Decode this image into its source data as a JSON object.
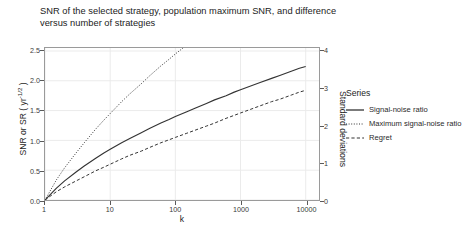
{
  "chart_data": {
    "type": "line",
    "title": "SNR of the selected strategy, population maximum SNR, and difference\nversus number of strategies",
    "xlabel": "k",
    "ylabel_left": "SNR or SR ( yr",
    "ylabel_left_exponent": "-1/2",
    "ylabel_left_tail": " )",
    "ylabel_right": "Standard deviations",
    "xscale": "log",
    "xlim": [
      1,
      16000
    ],
    "ylim_left": [
      0.0,
      2.55
    ],
    "ylim_right": [
      0.0,
      4.08
    ],
    "grid": true,
    "legend_position": "right",
    "legend_title": "Series",
    "xticks": [
      "1",
      "10",
      "100",
      "1000",
      "10000"
    ],
    "xtick_values": [
      1,
      10,
      100,
      1000,
      10000
    ],
    "yticks_left": [
      "0.0",
      "0.5",
      "1.0",
      "1.5",
      "2.0",
      "2.5"
    ],
    "ytick_values_left": [
      0.0,
      0.5,
      1.0,
      1.5,
      2.0,
      2.5
    ],
    "yticks_right": [
      "0",
      "1",
      "2",
      "3",
      "4"
    ],
    "ytick_values_right": [
      0,
      1,
      2,
      3,
      4
    ],
    "x": [
      1,
      1.5,
      2,
      3,
      4,
      6,
      8,
      10,
      15,
      20,
      30,
      40,
      60,
      80,
      100,
      150,
      200,
      300,
      400,
      600,
      800,
      1000,
      1500,
      2000,
      3000,
      4000,
      6000,
      8000,
      10000
    ],
    "series": [
      {
        "name": "Signal-noise ratio",
        "style": "solid",
        "color": "#333333",
        "values": [
          0.0,
          0.2,
          0.32,
          0.47,
          0.57,
          0.7,
          0.79,
          0.85,
          0.96,
          1.03,
          1.13,
          1.2,
          1.29,
          1.35,
          1.4,
          1.48,
          1.54,
          1.62,
          1.68,
          1.75,
          1.81,
          1.85,
          1.92,
          1.97,
          2.04,
          2.09,
          2.16,
          2.21,
          2.24
        ]
      },
      {
        "name": "Maximum signal-noise ratio",
        "style": "dotted",
        "color": "#333333",
        "values": [
          0.0,
          0.34,
          0.54,
          0.79,
          0.96,
          1.19,
          1.34,
          1.45,
          1.65,
          1.78,
          1.95,
          2.08,
          2.25,
          2.36,
          2.45,
          2.6,
          2.71,
          2.86,
          2.97,
          3.12,
          3.23,
          3.31,
          3.45,
          3.55,
          3.69,
          3.78,
          3.92,
          4.02,
          4.08
        ]
      },
      {
        "name": "Regret",
        "style": "dashed",
        "color": "#333333",
        "values": [
          0.0,
          0.14,
          0.22,
          0.32,
          0.39,
          0.49,
          0.55,
          0.6,
          0.69,
          0.75,
          0.82,
          0.88,
          0.96,
          1.01,
          1.05,
          1.12,
          1.17,
          1.24,
          1.29,
          1.37,
          1.42,
          1.46,
          1.53,
          1.58,
          1.65,
          1.69,
          1.76,
          1.81,
          1.84
        ]
      }
    ]
  },
  "title": "SNR of the selected strategy, population maximum SNR, and difference\nversus number of strategies",
  "axes": {
    "x_title": "k",
    "y_left_title_main": "SNR or SR ( yr",
    "y_left_title_sup": "-1/2",
    "y_left_title_end": " )",
    "y_right_title": "Standard deviations"
  },
  "legend": {
    "title": "Series",
    "items": [
      {
        "label": "Signal-noise ratio",
        "style": "solid"
      },
      {
        "label": "Maximum signal-noise ratio",
        "style": "dotted"
      },
      {
        "label": "Regret",
        "style": "dashed"
      }
    ]
  },
  "colors": {
    "line": "#333333",
    "grid": "#ebebeb",
    "panel_border": "#9a9a9a",
    "background": "#ffffff",
    "text": "#1d1d1d"
  }
}
